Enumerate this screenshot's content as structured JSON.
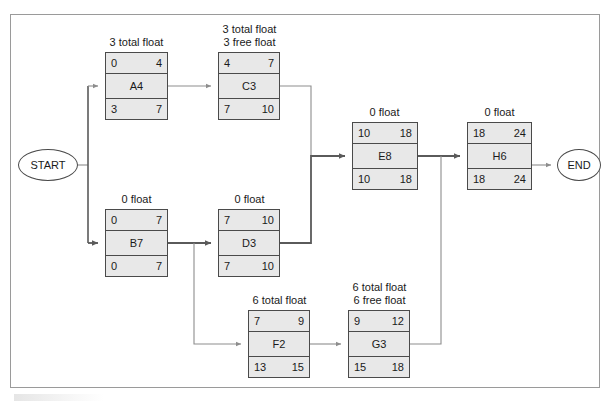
{
  "diagram": {
    "type": "precedence-network-diagram",
    "start_label": "START",
    "end_label": "END",
    "nodes": [
      {
        "id": "A4",
        "name": "A4",
        "float_label": "3 total float",
        "early_start": "0",
        "early_finish": "4",
        "late_start": "3",
        "late_finish": "7"
      },
      {
        "id": "C3",
        "name": "C3",
        "float_label": "3 total float\n3 free float",
        "float_label_line1": "3 total float",
        "float_label_line2": "3 free float",
        "early_start": "4",
        "early_finish": "7",
        "late_start": "7",
        "late_finish": "10"
      },
      {
        "id": "B7",
        "name": "B7",
        "float_label": "0 float",
        "early_start": "0",
        "early_finish": "7",
        "late_start": "0",
        "late_finish": "7"
      },
      {
        "id": "D3",
        "name": "D3",
        "float_label": "0 float",
        "early_start": "7",
        "early_finish": "10",
        "late_start": "7",
        "late_finish": "10"
      },
      {
        "id": "E8",
        "name": "E8",
        "float_label": "0 float",
        "early_start": "10",
        "early_finish": "18",
        "late_start": "10",
        "late_finish": "18"
      },
      {
        "id": "H6",
        "name": "H6",
        "float_label": "0 float",
        "early_start": "18",
        "early_finish": "24",
        "late_start": "18",
        "late_finish": "24"
      },
      {
        "id": "F2",
        "name": "F2",
        "float_label": "6 total float",
        "early_start": "7",
        "early_finish": "9",
        "late_start": "13",
        "late_finish": "15"
      },
      {
        "id": "G3",
        "name": "G3",
        "float_label": "6 total float\n6 free float",
        "float_label_line1": "6 total float",
        "float_label_line2": "6 free float",
        "early_start": "9",
        "early_finish": "12",
        "late_start": "15",
        "late_finish": "18"
      }
    ],
    "edges": [
      {
        "from": "START",
        "to": "A4"
      },
      {
        "from": "START",
        "to": "B7"
      },
      {
        "from": "A4",
        "to": "C3"
      },
      {
        "from": "C3",
        "to": "E8"
      },
      {
        "from": "B7",
        "to": "D3"
      },
      {
        "from": "B7",
        "to": "F2"
      },
      {
        "from": "D3",
        "to": "E8"
      },
      {
        "from": "E8",
        "to": "H6"
      },
      {
        "from": "F2",
        "to": "G3"
      },
      {
        "from": "G3",
        "to": "H6"
      },
      {
        "from": "H6",
        "to": "END"
      }
    ],
    "colors": {
      "node_fill": "#e8e8e8",
      "node_border": "#4a4a4a",
      "terminal_fill": "#ffffff",
      "frame_border": "#9a9a9a",
      "edge_thick": "#5a5a5a",
      "edge_thin": "#9a9a9a",
      "text": "#1a1a1a"
    }
  }
}
